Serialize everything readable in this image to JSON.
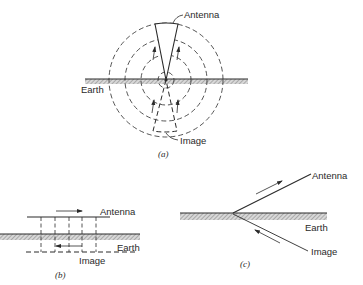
{
  "figure": {
    "panels": [
      {
        "id": "a",
        "caption": "(a)",
        "labels": {
          "antenna": "Antenna",
          "earth": "Earth",
          "image": "Image"
        }
      },
      {
        "id": "b",
        "caption": "(b)",
        "labels": {
          "antenna": "Antenna",
          "earth": "Earth",
          "image": "Image"
        }
      },
      {
        "id": "c",
        "caption": "(c)",
        "labels": {
          "antenna": "Antenna",
          "earth": "Earth",
          "image": "Image"
        }
      }
    ]
  },
  "colors": {
    "ink": "#2a2a2a",
    "hatch": "#8a8a8a",
    "background": "#ffffff"
  }
}
